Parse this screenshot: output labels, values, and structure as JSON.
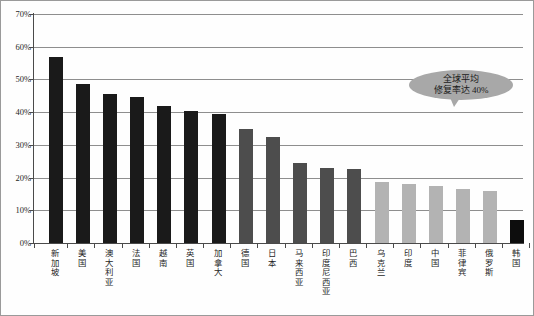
{
  "chart_data": {
    "type": "bar",
    "title": "",
    "xlabel": "",
    "ylabel": "",
    "ylim": [
      0,
      70
    ],
    "ytick_labels": [
      "70%",
      "60%",
      "50%",
      "40%",
      "30%",
      "20%",
      "10%",
      "0%"
    ],
    "ytick_values": [
      70,
      60,
      50,
      40,
      30,
      20,
      10,
      0
    ],
    "grid": true,
    "legend": null,
    "categories": [
      "新加坡",
      "美国",
      "澳大利亚",
      "法国",
      "越南",
      "英国",
      "加拿大",
      "德国",
      "日本",
      "马来西亚",
      "印度尼西亚",
      "巴西",
      "乌克兰",
      "印度",
      "中国",
      "菲律宾",
      "俄罗斯",
      "韩国"
    ],
    "values": [
      57,
      48.5,
      45.5,
      44.5,
      42,
      40.5,
      39.5,
      35,
      32.5,
      24.5,
      23,
      22.5,
      18.5,
      18,
      17.5,
      16.5,
      16,
      7
    ],
    "bar_colors": [
      "#1a1a1a",
      "#1a1a1a",
      "#1a1a1a",
      "#1a1a1a",
      "#1a1a1a",
      "#1a1a1a",
      "#1a1a1a",
      "#4d4d4d",
      "#4d4d4d",
      "#4d4d4d",
      "#4d4d4d",
      "#4d4d4d",
      "#b3b3b3",
      "#b3b3b3",
      "#b3b3b3",
      "#b3b3b3",
      "#b3b3b3",
      "#0d0d0d"
    ],
    "annotations": [
      {
        "name": "global-average-callout",
        "lines": [
          "全球平均",
          "修复率达 40%"
        ],
        "shape": "speech-bubble-ellipse",
        "fill": "#a8a8a8"
      }
    ]
  },
  "colors": {
    "grid": "#8e8e8e",
    "axis": "#4a4a4a",
    "background": "#fefefe",
    "frame_border": "#9a9a9a",
    "callout_fill": "#a8a8a8",
    "text": "#1a1a1a"
  }
}
